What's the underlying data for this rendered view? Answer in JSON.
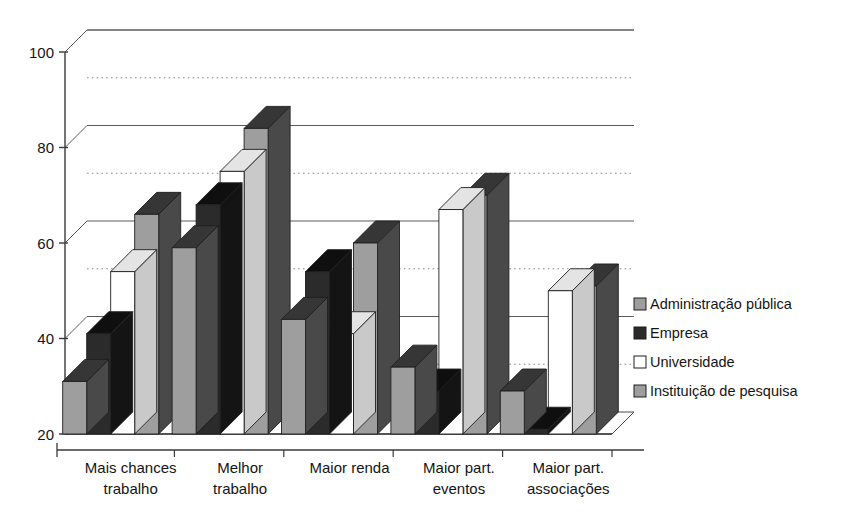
{
  "chart_data": {
    "type": "bar",
    "title": "",
    "xlabel": "",
    "ylabel": "",
    "ylim": [
      20,
      100
    ],
    "yticks": [
      20,
      40,
      60,
      80,
      100
    ],
    "yticklabels": [
      "20",
      "40",
      "60",
      "80",
      "100"
    ],
    "minor_gridlines": [
      30,
      50,
      70,
      90
    ],
    "grid": true,
    "legend_position": "right",
    "style": "3d-bar",
    "categories": [
      "Mais chances trabalho",
      "Melhor trabalho",
      "Maior renda",
      "Maior part. eventos",
      "Maior part. associações"
    ],
    "category_lines": [
      [
        "Mais chances",
        "trabalho"
      ],
      [
        "Melhor",
        "trabalho"
      ],
      [
        "Maior renda",
        ""
      ],
      [
        "Maior part.",
        "eventos"
      ],
      [
        "Maior part.",
        "associações"
      ]
    ],
    "series": [
      {
        "name": "Administração  pública",
        "color": "#9e9e9e",
        "values": [
          31,
          59,
          44,
          34,
          29
        ]
      },
      {
        "name": "Empresa",
        "color": "#2b2b2b",
        "values": [
          41,
          68,
          54,
          29,
          21
        ]
      },
      {
        "name": "Universidade",
        "color": "#ffffff",
        "values": [
          54,
          75,
          41,
          67,
          50
        ]
      },
      {
        "name": "Instituição de pesquisa",
        "color": "#9e9e9e",
        "values": [
          66,
          84,
          60,
          70,
          51
        ]
      }
    ]
  },
  "legend": {
    "items": [
      {
        "label": "Administração  pública",
        "color": "#9e9e9e"
      },
      {
        "label": "Empresa",
        "color": "#2b2b2b"
      },
      {
        "label": "Universidade",
        "color": "#ffffff"
      },
      {
        "label": "Instituição de pesquisa",
        "color": "#9e9e9e"
      }
    ]
  },
  "axis": {
    "y_tick_labels": [
      "100",
      "80",
      "60",
      "40",
      "20"
    ]
  }
}
